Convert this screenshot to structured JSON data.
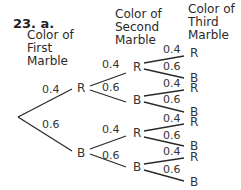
{
  "problem": {
    "number": "23. a."
  },
  "headers": {
    "first": [
      "Color of",
      "First",
      "Marble"
    ],
    "second": [
      "Color of",
      "Second",
      "Marble"
    ],
    "third": [
      "Color of",
      "Third",
      "Marble"
    ]
  },
  "tree": {
    "level1": [
      {
        "node": "R",
        "prob": "0.4"
      },
      {
        "node": "B",
        "prob": "0.6"
      }
    ],
    "level2": [
      {
        "node": "R",
        "prob": "0.4"
      },
      {
        "node": "B",
        "prob": "0.6"
      },
      {
        "node": "R",
        "prob": "0.4"
      },
      {
        "node": "B",
        "prob": "0.6"
      }
    ],
    "level3": [
      {
        "node": "R",
        "prob": "0.4"
      },
      {
        "node": "B",
        "prob": "0.6"
      },
      {
        "node": "R",
        "prob": "0.4"
      },
      {
        "node": "B",
        "prob": "0.6"
      },
      {
        "node": "R",
        "prob": "0.4"
      },
      {
        "node": "B",
        "prob": "0.6"
      },
      {
        "node": "R",
        "prob": "0.4"
      },
      {
        "node": "B",
        "prob": "0.6"
      }
    ]
  },
  "colors": {
    "ink": "#2a2a2a",
    "background": "#ffffff"
  }
}
